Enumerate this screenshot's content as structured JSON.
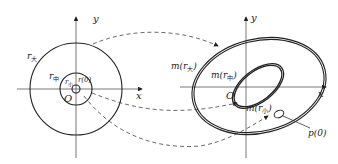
{
  "left_diagram": {
    "axis_x": "x",
    "axis_y": "y",
    "origin": "O",
    "labels": {
      "r_big": "r",
      "r_big_sub": "大",
      "r_mid": "r",
      "r_mid_sub": "中",
      "r_small": "r",
      "r_small_sub": "小",
      "r0": "r(0)"
    }
  },
  "right_diagram": {
    "axis_x": "x",
    "axis_y": "y",
    "origin": "O",
    "labels": {
      "m_big_pre": "m(r",
      "m_big_sub": "大",
      "m_mid_pre": "m(r",
      "m_mid_sub": "中",
      "m_small_pre": "m(r",
      "m_small_sub": "小",
      "close": ")",
      "p0": "p(0)"
    }
  },
  "colors": {
    "stroke": "#222222",
    "dashed": "#444444"
  }
}
